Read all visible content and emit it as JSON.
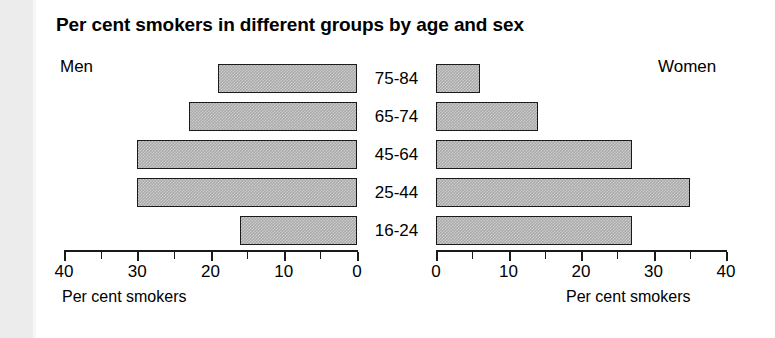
{
  "chart_data": {
    "type": "bar",
    "orientation": "horizontal",
    "subtype": "population-pyramid",
    "title": "Per cent smokers in different groups by age and sex",
    "categories": [
      "75-84",
      "65-74",
      "45-64",
      "25-44",
      "16-24"
    ],
    "series": [
      {
        "name": "Men",
        "values": [
          19,
          23,
          30,
          30,
          16
        ]
      },
      {
        "name": "Women",
        "values": [
          6,
          14,
          27,
          35,
          27
        ]
      }
    ],
    "xlabel": "Per cent smokers",
    "ylabel": "",
    "xlim": [
      0,
      40
    ],
    "left_tick_labels": [
      "40",
      "30",
      "20",
      "10",
      "0"
    ],
    "right_tick_labels": [
      "0",
      "10",
      "20",
      "30",
      "40"
    ],
    "tick_step": 10,
    "minor_tick_step": 5,
    "grid": false,
    "legend": "none",
    "bar_fill_color": "#a9a9a9",
    "bar_edge_color": "#1a1a1a"
  },
  "labels": {
    "men": "Men",
    "women": "Women",
    "axis_title_left": "Per cent smokers",
    "axis_title_right": "Per cent smokers"
  }
}
